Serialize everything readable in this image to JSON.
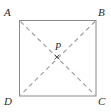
{
  "figure": {
    "kind": "geometry-diagram",
    "shape": "square",
    "background_color": "#ffffff",
    "stroke_color": "#8a8a8a",
    "dash_color": "#9a9a9a",
    "label_color": "#2b2b2b",
    "square": {
      "left": 19,
      "top": 20,
      "right": 96,
      "bottom": 96,
      "side_px": 77
    },
    "vertices": [
      {
        "id": "A",
        "label": "A",
        "x": 19,
        "y": 20,
        "label_x": 4,
        "label_y": 7
      },
      {
        "id": "B",
        "label": "B",
        "x": 96,
        "y": 20,
        "label_x": 98,
        "label_y": 7
      },
      {
        "id": "C",
        "label": "C",
        "x": 96,
        "y": 96,
        "label_x": 98,
        "label_y": 96
      },
      {
        "id": "D",
        "label": "D",
        "x": 19,
        "y": 96,
        "label_x": 4,
        "label_y": 96
      }
    ],
    "diagonals": [
      {
        "id": "AC",
        "from": "A",
        "to": "C",
        "style": "dashed"
      },
      {
        "id": "BD",
        "from": "B",
        "to": "D",
        "style": "dashed"
      }
    ],
    "interior_point": {
      "id": "P",
      "label": "P",
      "x": 57,
      "y": 57,
      "marker": "x-cross",
      "label_x": 55,
      "label_y": 42
    }
  }
}
